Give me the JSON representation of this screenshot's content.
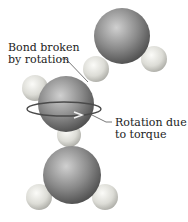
{
  "labels": {
    "bond_line1": "Bond broken",
    "bond_line2": "by rotation",
    "rotation_line1": "Rotation due",
    "rotation_line2": "to torque"
  },
  "colors": {
    "oxygen": "#6e6e6e",
    "hydrogen": "#d8d8d4",
    "arrow": "#555555",
    "text": "#222222"
  }
}
